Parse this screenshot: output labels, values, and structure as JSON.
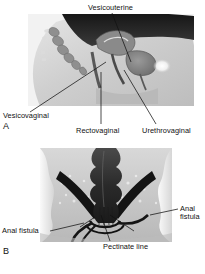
{
  "figure": {
    "background_color": "#ffffff",
    "text_color": "#111111",
    "panels": [
      {
        "letter": "A",
        "view": "sagittal-female-pelvis",
        "description": "Midsagittal section of the female pelvis showing sites of vaginal fistulas",
        "labels": [
          {
            "id": "vesicouterine",
            "text": "Vesicouterine"
          },
          {
            "id": "vesicovaginal",
            "text": "Vesicovaginal"
          },
          {
            "id": "rectovaginal",
            "text": "Rectovaginal"
          },
          {
            "id": "urethrovaginal",
            "text": "Urethrovaginal"
          }
        ]
      },
      {
        "letter": "B",
        "view": "coronal-anorectum",
        "description": "Coronal section of the anorectal region showing anal fistulas and landmarks",
        "labels": [
          {
            "id": "anal-fistula-left",
            "text": "Anal fistula"
          },
          {
            "id": "sphincter-muscles",
            "text": "Sphincter muscles"
          },
          {
            "id": "pectinate-line",
            "text": "Pectinate line"
          },
          {
            "id": "anal-crypt",
            "text": "Anal crypt"
          },
          {
            "id": "anal-fistula-right",
            "text": "Anal fistula"
          }
        ]
      }
    ]
  }
}
